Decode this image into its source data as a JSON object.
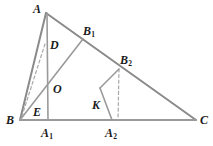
{
  "figure": {
    "width": 213,
    "height": 146,
    "background_color": "#ffffff",
    "stroke_color": "#7a7a7a",
    "label_color": "#1a1a1a",
    "labels": {
      "A": "A",
      "B": "B",
      "C": "C",
      "D": "D",
      "E": "E",
      "O": "O",
      "K": "K",
      "B1_base": "B",
      "B1_sub": "1",
      "B2_base": "B",
      "B2_sub": "2",
      "A1_base": "A",
      "A1_sub": "1",
      "A2_base": "A",
      "A2_sub": "2"
    },
    "points": {
      "A": {
        "x": 46,
        "y": 13
      },
      "B": {
        "x": 20,
        "y": 120
      },
      "C": {
        "x": 196,
        "y": 120
      },
      "A1": {
        "x": 48,
        "y": 120
      },
      "A2": {
        "x": 119,
        "y": 120
      },
      "B1": {
        "x": 83,
        "y": 39
      },
      "B2": {
        "x": 119,
        "y": 69
      },
      "D": {
        "x": 44,
        "y": 45
      },
      "O": {
        "x": 48,
        "y": 84
      },
      "E": {
        "x": 31,
        "y": 113
      },
      "K": {
        "x": 100,
        "y": 88
      }
    },
    "segments": [
      {
        "name": "side-AB",
        "from": "A",
        "to": "B",
        "style": "solid"
      },
      {
        "name": "side-AC",
        "from": "A",
        "to": "C",
        "style": "solid"
      },
      {
        "name": "side-BC",
        "from": "B",
        "to": "C",
        "style": "solid"
      },
      {
        "name": "altitude-A-A1",
        "from": "A",
        "to": "A1",
        "style": "solid"
      },
      {
        "name": "cevian-B1-B",
        "from": "B1",
        "to": "B",
        "style": "solid"
      },
      {
        "name": "segment-B2-A2",
        "from": "B2",
        "to": "A2",
        "style": "dashed"
      },
      {
        "name": "segment-B2-K",
        "from": "B2",
        "to": "K",
        "style": "solid"
      },
      {
        "name": "segment-K-A2",
        "from": "K",
        "to": "A2",
        "style": "solid"
      },
      {
        "name": "dashed-D-B",
        "from": "D",
        "to": "B",
        "style": "dashed"
      }
    ]
  }
}
